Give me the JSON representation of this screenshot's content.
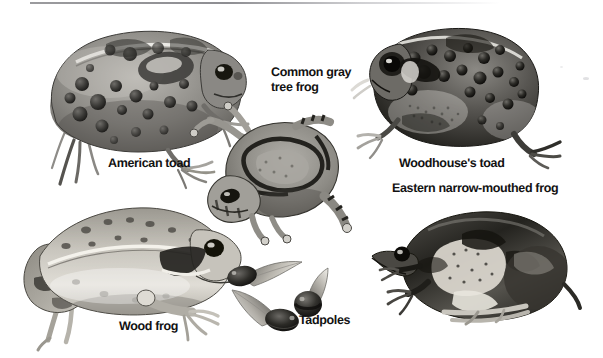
{
  "plate": {
    "title": "Amphibians of the region illustration plate",
    "background_color": "#ffffff",
    "ink_color": "#121212",
    "rule_color": "#8e8e92",
    "width": 603,
    "height": 358
  },
  "labels": {
    "american_toad": "American toad",
    "common_gray_tree_frog": "Common gray\ntree frog",
    "woodhouses_toad": "Woodhouse's toad",
    "eastern_narrow_mouthed_frog": "Eastern narrow-mouthed frog",
    "wood_frog": "Wood frog",
    "tadpoles": "Tadpoles"
  },
  "figures": [
    {
      "name": "american-toad",
      "label": "American toad",
      "view": "side, facing right",
      "x": 28,
      "y": 16,
      "w": 222,
      "h": 162
    },
    {
      "name": "common-gray-tree-frog",
      "label": "Common gray tree frog",
      "view": "top-down, facing lower-left",
      "x": 203,
      "y": 108,
      "w": 146,
      "h": 130
    },
    {
      "name": "woodhouses-toad",
      "label": "Woodhouse's toad",
      "view": "side, facing left",
      "x": 372,
      "y": 24,
      "w": 194,
      "h": 140
    },
    {
      "name": "eastern-narrow-mouthed-frog",
      "label": "Eastern narrow-mouthed frog",
      "view": "side, facing left",
      "x": 368,
      "y": 200,
      "w": 208,
      "h": 138
    },
    {
      "name": "wood-frog",
      "label": "Wood frog",
      "view": "side, facing right",
      "x": 8,
      "y": 196,
      "w": 228,
      "h": 148
    },
    {
      "name": "tadpole-upper",
      "label": "Tadpoles",
      "view": "swimming, tail up-right",
      "x": 232,
      "y": 263,
      "w": 68,
      "h": 28
    },
    {
      "name": "tadpole-lower",
      "label": "Tadpoles",
      "view": "swimming, tail up-left",
      "x": 234,
      "y": 290,
      "w": 62,
      "h": 42
    },
    {
      "name": "tadpole-right",
      "label": "Tadpoles",
      "view": "front, tail curled",
      "x": 294,
      "y": 272,
      "w": 38,
      "h": 50
    }
  ]
}
